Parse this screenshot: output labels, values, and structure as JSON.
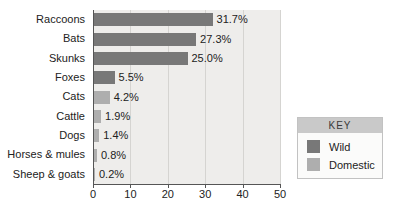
{
  "chart_data": {
    "type": "bar",
    "orientation": "horizontal",
    "title": "",
    "categories": [
      "Raccoons",
      "Bats",
      "Skunks",
      "Foxes",
      "Cats",
      "Cattle",
      "Dogs",
      "Horses & mules",
      "Sheep & goats"
    ],
    "values": [
      31.7,
      27.3,
      25.0,
      5.5,
      4.2,
      1.9,
      1.4,
      0.8,
      0.2
    ],
    "value_labels": [
      "31.7%",
      "27.3%",
      "25.0%",
      "5.5%",
      "4.2%",
      "1.9%",
      "1.4%",
      "0.8%",
      "0.2%"
    ],
    "series_of_category": [
      "Wild",
      "Wild",
      "Wild",
      "Wild",
      "Domestic",
      "Domestic",
      "Domestic",
      "Domestic",
      "Domestic"
    ],
    "xlabel": "",
    "ylabel": "",
    "xlim": [
      0,
      50
    ],
    "x_ticks": [
      0,
      10,
      20,
      30,
      40,
      50
    ],
    "grid": true,
    "legend": {
      "title": "KEY",
      "position": "right",
      "entries": [
        {
          "label": "Wild",
          "color": "#787878"
        },
        {
          "label": "Domestic",
          "color": "#aeaeae"
        }
      ]
    }
  },
  "colors": {
    "wild_bar": "#787878",
    "domestic_bar": "#aeaeae",
    "plot_background": "#eeedeb",
    "gridline": "#d5d4d1",
    "axis": "#555555",
    "legend_header_background": "#c9c9c9",
    "legend_border": "#c2c2c2",
    "text": "#222222"
  }
}
